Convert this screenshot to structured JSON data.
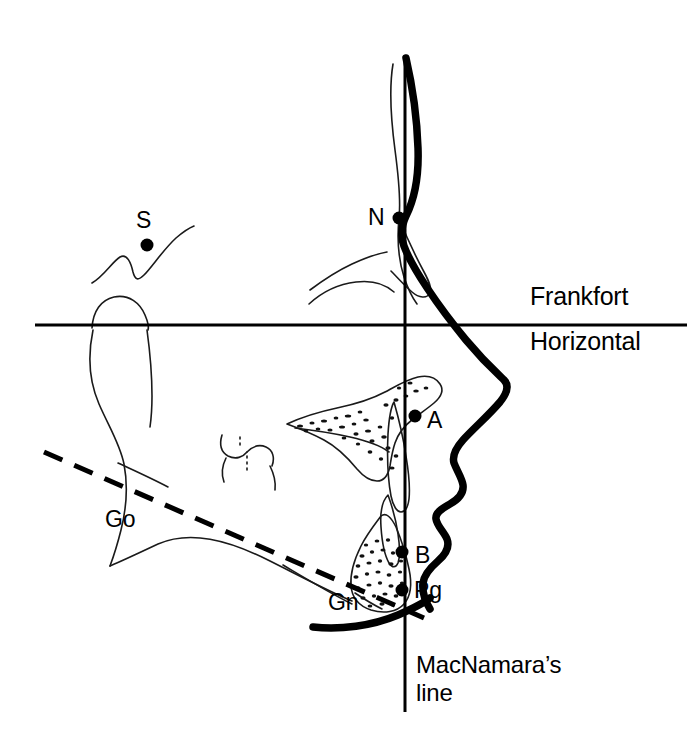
{
  "figure": {
    "type": "cephalometric-tracing",
    "background_color": "#ffffff",
    "ink_color": "#000000"
  },
  "landmarks": [
    {
      "id": "S",
      "label": "S",
      "label_x": 136,
      "label_y": 208,
      "dot_x": 147,
      "dot_y": 245,
      "dot_r": 6.5,
      "name": "sella"
    },
    {
      "id": "N",
      "label": "N",
      "label_x": 368,
      "label_y": 205,
      "dot_x": 399,
      "dot_y": 218,
      "dot_r": 6.5,
      "name": "nasion"
    },
    {
      "id": "A",
      "label": "A",
      "label_x": 427,
      "label_y": 408,
      "dot_x": 415,
      "dot_y": 416,
      "dot_r": 6.5,
      "name": "a-point"
    },
    {
      "id": "B",
      "label": "B",
      "label_x": 415,
      "label_y": 543,
      "dot_x": 402,
      "dot_y": 552,
      "dot_r": 6.5,
      "name": "b-point"
    },
    {
      "id": "Pg",
      "label": "Pg",
      "label_x": 414,
      "label_y": 578,
      "dot_x": 402,
      "dot_y": 590,
      "dot_r": 6.5,
      "name": "pogonion"
    },
    {
      "id": "Go",
      "label": "Go",
      "label_x": 105,
      "label_y": 507,
      "dot_x": null,
      "dot_y": null,
      "dot_r": 0,
      "name": "gonion"
    },
    {
      "id": "Gn",
      "label": "Gn",
      "label_x": 328,
      "label_y": 590,
      "dot_x": null,
      "dot_y": null,
      "dot_r": 0,
      "name": "gnathion"
    }
  ],
  "planes": {
    "frankfort": {
      "line1": "Frankfort",
      "line2": "Horizontal",
      "label1_x": 530,
      "label1_y": 282,
      "label2_x": 530,
      "label2_y": 327,
      "y": 325,
      "x_start": 35,
      "x_end": 687,
      "stroke_width": 3
    },
    "mcnamara": {
      "line1": "MacNamara’s",
      "line2": "line",
      "label1_x": 416,
      "label1_y": 652,
      "label2_x": 416,
      "label2_y": 680,
      "x": 405,
      "y_start": 55,
      "y_end": 712,
      "stroke_width": 3
    },
    "mandibular": {
      "name": "mandibular-plane",
      "x1": 44,
      "y1": 452,
      "x2": 424,
      "y2": 618,
      "stroke_width": 5,
      "dash": "20 13"
    }
  }
}
